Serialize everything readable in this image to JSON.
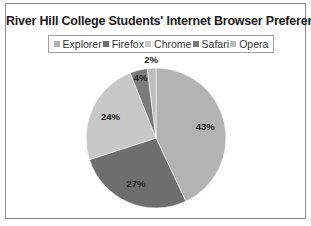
{
  "chart_data": {
    "type": "pie",
    "title": "River Hill College Students' Internet Browser Preferences",
    "legend_position": "top",
    "start_angle": "12 o'clock, clockwise",
    "categories": [
      "Explorer",
      "Firefox",
      "Chrome",
      "Safari",
      "Opera"
    ],
    "values": [
      43,
      27,
      24,
      4,
      2
    ],
    "data_labels": [
      "43%",
      "27%",
      "24%",
      "4%",
      "2%"
    ],
    "colors": [
      "#b3b3b3",
      "#6e6e6e",
      "#c8c8c8",
      "#7a7a7a",
      "#bdbdbd"
    ]
  }
}
